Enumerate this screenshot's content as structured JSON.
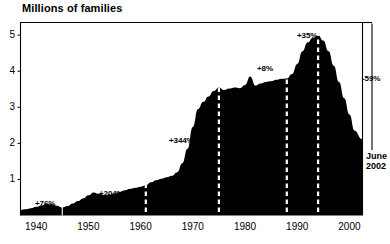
{
  "chart_data": {
    "type": "area",
    "title": "Millions of families",
    "xlabel": "",
    "ylabel": "Millions of families",
    "xlim": [
      1937,
      2002.5
    ],
    "ylim": [
      0,
      5.35
    ],
    "grid": false,
    "legend": "none",
    "fill_color": "#000000",
    "background_color": "#ffffff",
    "yticks": [
      "1",
      "2",
      "3",
      "4",
      "5"
    ],
    "ytick_values": [
      1,
      2,
      3,
      4,
      5
    ],
    "xticks": [
      "1940",
      "1950",
      "1960",
      "1970",
      "1980",
      "1990",
      "2000"
    ],
    "xtick_values": [
      1940,
      1950,
      1960,
      1970,
      1980,
      1990,
      2000
    ],
    "x": [
      1937,
      1938,
      1939,
      1940,
      1941,
      1942,
      1943,
      1944,
      1945,
      1946,
      1947,
      1948,
      1949,
      1950,
      1951,
      1952,
      1953,
      1954,
      1955,
      1956,
      1957,
      1958,
      1959,
      1960,
      1961,
      1962,
      1963,
      1964,
      1965,
      1966,
      1967,
      1968,
      1969,
      1970,
      1971,
      1972,
      1973,
      1974,
      1975,
      1976,
      1977,
      1978,
      1979,
      1980,
      1981,
      1982,
      1983,
      1984,
      1985,
      1986,
      1987,
      1988,
      1989,
      1990,
      1991,
      1992,
      1993,
      1994,
      1995,
      1996,
      1997,
      1998,
      1999,
      2000,
      2001,
      2002.4
    ],
    "y": [
      0.15,
      0.17,
      0.2,
      0.24,
      0.28,
      0.32,
      0.31,
      0.27,
      0.22,
      0.26,
      0.33,
      0.4,
      0.47,
      0.56,
      0.64,
      0.6,
      0.57,
      0.58,
      0.61,
      0.65,
      0.7,
      0.74,
      0.77,
      0.8,
      0.84,
      0.92,
      0.98,
      1.02,
      1.06,
      1.1,
      1.2,
      1.45,
      1.85,
      2.45,
      2.95,
      3.15,
      3.3,
      3.45,
      3.55,
      3.48,
      3.52,
      3.55,
      3.53,
      3.62,
      3.85,
      3.6,
      3.66,
      3.7,
      3.72,
      3.76,
      3.79,
      3.8,
      3.92,
      4.2,
      4.55,
      4.8,
      4.93,
      5.0,
      4.85,
      4.55,
      4.15,
      3.7,
      3.25,
      2.8,
      2.35,
      2.12
    ],
    "vertical_markers": [
      {
        "year": 1945,
        "style": "solid-thin",
        "color": "#ffffff"
      },
      {
        "year": 1961,
        "style": "dashed",
        "color": "#ffffff"
      },
      {
        "year": 1975,
        "style": "dashed",
        "color": "#ffffff"
      },
      {
        "year": 1988,
        "style": "dashed",
        "color": "#ffffff"
      },
      {
        "year": 1994,
        "style": "dashed",
        "color": "#ffffff"
      }
    ],
    "annotations": [
      {
        "id": "ann-76",
        "text": "+76%",
        "x_px": 35,
        "y_px": 199,
        "color": "black"
      },
      {
        "id": "ann-204",
        "text": "+204%",
        "x_px": 99,
        "y_px": 189,
        "color": "black"
      },
      {
        "id": "ann-344",
        "text": "+344%",
        "x_px": 169,
        "y_px": 136,
        "color": "black"
      },
      {
        "id": "ann-8",
        "text": "+8%",
        "x_px": 257,
        "y_px": 64,
        "color": "black"
      },
      {
        "id": "ann-35",
        "text": "+35%",
        "x_px": 297,
        "y_px": 31,
        "color": "black"
      },
      {
        "id": "ann-59",
        "text": "-59%",
        "x_px": 362,
        "y_px": 74,
        "color": "black"
      }
    ],
    "end_label": {
      "line1": "June",
      "line2": "2002"
    }
  }
}
